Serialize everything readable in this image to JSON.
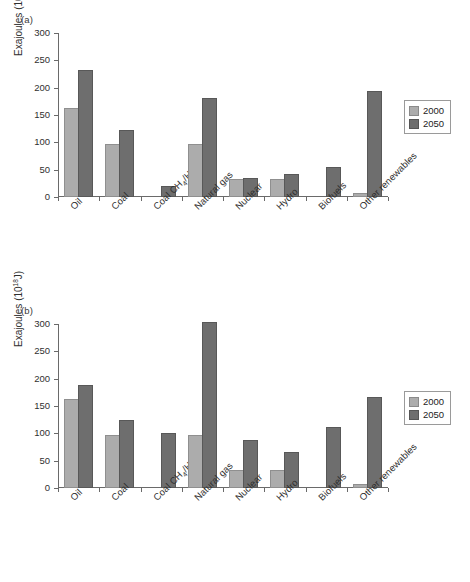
{
  "figure": {
    "panels": [
      {
        "id": "a",
        "label": "(a)"
      },
      {
        "id": "b",
        "label": "(b)"
      }
    ],
    "legend": {
      "entries": [
        {
          "key": "2000",
          "label": "2000",
          "color": "#acacac"
        },
        {
          "key": "2050",
          "label": "2050",
          "color": "#6e6e6e"
        }
      ]
    },
    "axis": {
      "ylabel_text": "Exajoules (10",
      "ylabel_sup": "18",
      "ylabel_tail": "J)",
      "yticks": [
        "0",
        "50",
        "100",
        "150",
        "200",
        "250",
        "300"
      ]
    },
    "caption_fragment": ""
  },
  "chart_data": [
    {
      "type": "bar",
      "panel": "(a)",
      "title": "",
      "xlabel": "",
      "ylabel": "Exajoules (10^18 J)",
      "ylim": [
        0,
        300
      ],
      "yticks": [
        0,
        50,
        100,
        150,
        200,
        250,
        300
      ],
      "grid": false,
      "legend_position": "right",
      "categories": [
        "Oil",
        "Coal",
        "Coal CH4/H2",
        "Natural gas",
        "Nuclear",
        "Hydro",
        "Biofuels",
        "Other renewables"
      ],
      "series": [
        {
          "name": "2000",
          "color": "#acacac",
          "values": [
            159,
            94,
            0,
            94,
            29,
            29,
            0,
            3
          ]
        },
        {
          "name": "2050",
          "color": "#6e6e6e",
          "values": [
            229,
            119,
            16,
            177,
            31,
            38,
            51,
            190
          ]
        }
      ]
    },
    {
      "type": "bar",
      "panel": "(b)",
      "title": "",
      "xlabel": "",
      "ylabel": "Exajoules (10^18 J)",
      "ylim": [
        0,
        300
      ],
      "yticks": [
        0,
        50,
        100,
        150,
        200,
        250,
        300
      ],
      "grid": false,
      "legend_position": "right",
      "categories": [
        "Oil",
        "Coal",
        "Coal CH4/H2",
        "Natural gas",
        "Nuclear",
        "Hydro",
        "Biofuels",
        "Other renewables"
      ],
      "series": [
        {
          "name": "2000",
          "color": "#acacac",
          "values": [
            159,
            94,
            0,
            94,
            29,
            29,
            0,
            3
          ]
        },
        {
          "name": "2050",
          "color": "#6e6e6e",
          "values": [
            185,
            120,
            97,
            300,
            84,
            63,
            108,
            163
          ]
        }
      ]
    }
  ],
  "xlabels": [
    {
      "pre": "Oil",
      "sub": "",
      "post": ""
    },
    {
      "pre": "Coal",
      "sub": "",
      "post": ""
    },
    {
      "pre": "Coal CH",
      "sub": "4",
      "post": "/H",
      "sub2": "2"
    },
    {
      "pre": "Natural gas",
      "sub": "",
      "post": ""
    },
    {
      "pre": "Nuclear",
      "sub": "",
      "post": ""
    },
    {
      "pre": "Hydro",
      "sub": "",
      "post": ""
    },
    {
      "pre": "Biofuels",
      "sub": "",
      "post": ""
    },
    {
      "pre": "Other renewables",
      "sub": "",
      "post": ""
    }
  ]
}
